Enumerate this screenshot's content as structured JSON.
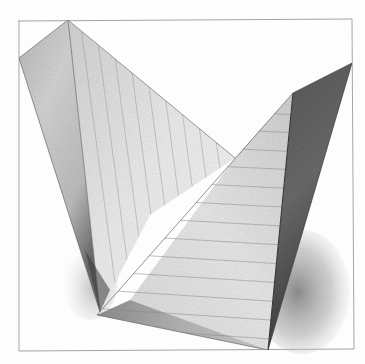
{
  "artwork": {
    "title": "Pencil drawing of two intersecting pyramidal forms",
    "medium": "graphite on paper",
    "colors": {
      "paper": "#fdfdfd",
      "frame": "#8a8a8a",
      "light_face": "#e6e6e6",
      "mid_face": "#c4c4c4",
      "dark_face": "#6f6f6f",
      "shadow": "#9a9a9a",
      "hatch_line": "#8c8c8c"
    },
    "frame": {
      "x": 18,
      "y": 20,
      "width": 335,
      "height": 331
    }
  }
}
